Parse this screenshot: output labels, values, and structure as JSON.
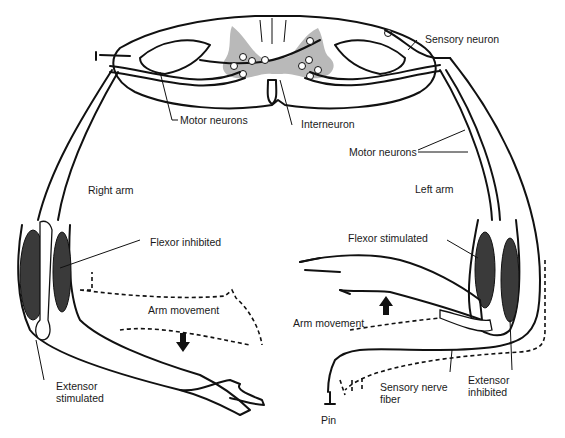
{
  "diagram": {
    "colors": {
      "ink": "#111111",
      "gray_matter": "#b9b9b9",
      "muscle": "#3a3a3a",
      "background": "#ffffff"
    },
    "labels": {
      "sensory_neuron": "Sensory neuron",
      "motor_neurons_left": "Motor neurons",
      "interneuron": "Interneuron",
      "motor_neurons_right": "Motor neurons",
      "right_arm": "Right arm",
      "left_arm": "Left arm",
      "flexor_inhibited": "Flexor inhibited",
      "flexor_stimulated": "Flexor stimulated",
      "arm_movement_right": "Arm movement",
      "arm_movement_left": "Arm movement",
      "extensor_stimulated_1": "Extensor",
      "extensor_stimulated_2": "stimulated",
      "extensor_inhibited_1": "Extensor",
      "extensor_inhibited_2": "inhibited",
      "sensory_nerve_fiber_1": "Sensory nerve",
      "sensory_nerve_fiber_2": "fiber",
      "pin": "Pin"
    },
    "arrows": {
      "right_arm_movement": "down",
      "left_arm_movement": "up"
    }
  }
}
